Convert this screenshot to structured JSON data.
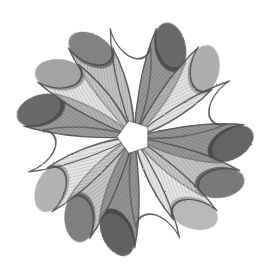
{
  "artwork": {
    "title": "Rosette of Overlapping Teardrop Petals",
    "medium": "pencil-and-wash drawing",
    "background_color": "#ffffff",
    "outline_color": "#4a4a4a",
    "canvas": {
      "width": 270,
      "height": 275
    },
    "center": {
      "x": 134,
      "y": 137
    },
    "core": {
      "shape": "pentagon",
      "fill": "#ffffff",
      "radius": 17,
      "rotation_deg": -18
    },
    "petal_geometry": {
      "count": 15,
      "length": 112,
      "max_width": 46,
      "tip_radius": 23,
      "skew_deg": 26,
      "stroke_width": 1.6
    },
    "palette": {
      "empty": "#ffffff",
      "light": "#c9c9c9",
      "medium": "#9a9a9a",
      "dark": "#6a6a6a",
      "darkest": "#3f3f3f"
    },
    "petals": [
      {
        "index": 0,
        "angle_deg": 0,
        "fill": "#9a9a9a",
        "opacity": 0.62,
        "tip_fill": "#5a5a5a"
      },
      {
        "index": 1,
        "angle_deg": 24,
        "fill": "#ffffff",
        "opacity": 0.0,
        "tip_fill": "#ffffff"
      },
      {
        "index": 2,
        "angle_deg": 48,
        "fill": "#6a6a6a",
        "opacity": 0.7,
        "tip_fill": "#3f3f3f"
      },
      {
        "index": 3,
        "angle_deg": 72,
        "fill": "#c9c9c9",
        "opacity": 0.55,
        "tip_fill": "#8a8a8a"
      },
      {
        "index": 4,
        "angle_deg": 96,
        "fill": "#ffffff",
        "opacity": 0.0,
        "tip_fill": "#ffffff"
      },
      {
        "index": 5,
        "angle_deg": 120,
        "fill": "#6a6a6a",
        "opacity": 0.72,
        "tip_fill": "#3a3a3a"
      },
      {
        "index": 6,
        "angle_deg": 144,
        "fill": "#9a9a9a",
        "opacity": 0.6,
        "tip_fill": "#4a4a4a"
      },
      {
        "index": 7,
        "angle_deg": 168,
        "fill": "#c9c9c9",
        "opacity": 0.5,
        "tip_fill": "#909090"
      },
      {
        "index": 8,
        "angle_deg": 192,
        "fill": "#ffffff",
        "opacity": 0.0,
        "tip_fill": "#ffffff"
      },
      {
        "index": 9,
        "angle_deg": 216,
        "fill": "#6a6a6a",
        "opacity": 0.74,
        "tip_fill": "#353535"
      },
      {
        "index": 10,
        "angle_deg": 240,
        "fill": "#9a9a9a",
        "opacity": 0.58,
        "tip_fill": "#4f4f4f"
      },
      {
        "index": 11,
        "angle_deg": 264,
        "fill": "#c9c9c9",
        "opacity": 0.52,
        "tip_fill": "#8a8a8a"
      },
      {
        "index": 12,
        "angle_deg": 288,
        "fill": "#ffffff",
        "opacity": 0.0,
        "tip_fill": "#ffffff"
      },
      {
        "index": 13,
        "angle_deg": 312,
        "fill": "#6a6a6a",
        "opacity": 0.68,
        "tip_fill": "#3f3f3f"
      },
      {
        "index": 14,
        "angle_deg": 336,
        "fill": "#c9c9c9",
        "opacity": 0.55,
        "tip_fill": "#7a7a7a"
      }
    ]
  }
}
